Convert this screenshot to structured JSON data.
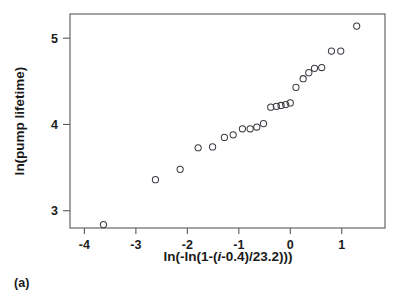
{
  "figure": {
    "panel_label": "(a)",
    "frame_color": "#55585c",
    "marker_color": "#3a3d42",
    "background": "#ffffff"
  },
  "chart_data": {
    "type": "scatter",
    "title": "",
    "subtitle": "",
    "xlabel": "ln(-ln(1-(i-0.4)/23.2)))",
    "xlabel_parts": [
      "ln(-ln(1-(",
      "i",
      "-0.4)/23.2)))"
    ],
    "ylabel": "ln(pump lifetime)",
    "xlim": [
      -4.28,
      1.84
    ],
    "ylim": [
      2.8,
      5.28
    ],
    "xticks": [
      -4,
      -3,
      -2,
      -1,
      0,
      1
    ],
    "xticklabels": [
      "-4",
      "-3",
      "-2",
      "-1",
      "0",
      "1"
    ],
    "yticks": [
      3,
      4,
      5
    ],
    "yticklabels": [
      "3",
      "4",
      "5"
    ],
    "grid": false,
    "legend": null,
    "marker": "open-circle",
    "n_points": 23,
    "x": [
      -3.63,
      -2.62,
      -2.14,
      -1.79,
      -1.51,
      -1.28,
      -1.11,
      -0.93,
      -0.81,
      -0.68,
      -0.55,
      -0.39,
      -0.28,
      -0.19,
      -0.11,
      -0.02,
      0.11,
      0.25,
      0.37,
      0.49,
      0.62,
      0.81,
      0.99,
      1.3
    ],
    "y": [
      2.84,
      3.36,
      3.48,
      3.73,
      3.74,
      3.85,
      3.88,
      3.95,
      3.95,
      3.97,
      4.01,
      4.2,
      4.22,
      4.22,
      4.23,
      4.25,
      4.43,
      4.53,
      4.6,
      4.65,
      4.66,
      4.85,
      4.85,
      5.14
    ],
    "points": [
      {
        "x": -3.63,
        "y": 2.84
      },
      {
        "x": -2.62,
        "y": 3.36
      },
      {
        "x": -2.14,
        "y": 3.48
      },
      {
        "x": -1.79,
        "y": 3.73
      },
      {
        "x": -1.51,
        "y": 3.74
      },
      {
        "x": -1.28,
        "y": 3.85
      },
      {
        "x": -1.11,
        "y": 3.88
      },
      {
        "x": -0.93,
        "y": 3.95
      },
      {
        "x": -0.78,
        "y": 3.95
      },
      {
        "x": -0.65,
        "y": 3.97
      },
      {
        "x": -0.52,
        "y": 4.01
      },
      {
        "x": -0.38,
        "y": 4.2
      },
      {
        "x": -0.27,
        "y": 4.21
      },
      {
        "x": -0.18,
        "y": 4.22
      },
      {
        "x": -0.09,
        "y": 4.23
      },
      {
        "x": 0.0,
        "y": 4.25
      },
      {
        "x": 0.11,
        "y": 4.43
      },
      {
        "x": 0.25,
        "y": 4.53
      },
      {
        "x": 0.36,
        "y": 4.6
      },
      {
        "x": 0.47,
        "y": 4.65
      },
      {
        "x": 0.61,
        "y": 4.66
      },
      {
        "x": 0.8,
        "y": 4.85
      },
      {
        "x": 0.98,
        "y": 4.85
      },
      {
        "x": 1.29,
        "y": 5.14
      }
    ]
  }
}
